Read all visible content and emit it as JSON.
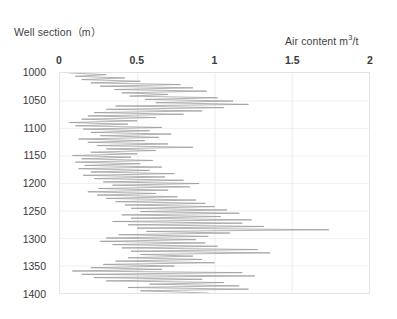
{
  "labels": {
    "y_axis_title": "Well section（m）",
    "x_axis_title_text": "Air content m",
    "x_axis_title_sup": "3",
    "x_axis_title_tail": "/t",
    "x_axis_title_full": "Air content m3/t"
  },
  "colors": {
    "series_line": "#9a9a9a",
    "plot_border": "#e3e3e5",
    "gridline_vertical": "#ececed",
    "gridline_horizontal": "#f1f1f2",
    "text": "#3a3a3a",
    "background": "#ffffff"
  },
  "chart_data": {
    "type": "line",
    "title": "",
    "subtitle": "",
    "orientation": "vertical-depth-log",
    "xlabel": "Air content m3/t",
    "ylabel": "Well section（m）",
    "xlim": [
      0,
      2
    ],
    "ylim": [
      1400,
      1000
    ],
    "y_inverted": true,
    "grid": true,
    "grid_axis": "both",
    "legend": false,
    "legend_position": "none",
    "xticks": [
      0,
      0.5,
      1,
      1.5,
      2
    ],
    "xtick_labels": [
      "0",
      "0.5",
      "1",
      "1.5",
      "2"
    ],
    "yticks": [
      1000,
      1050,
      1100,
      1150,
      1200,
      1250,
      1300,
      1350,
      1400
    ],
    "ytick_labels": [
      "1000",
      "1050",
      "1100",
      "1150",
      "1200",
      "1250",
      "1300",
      "1350",
      "1400"
    ],
    "annotations": [],
    "series": [
      {
        "name": "Air content",
        "x_key": "air_content",
        "y_key": "depth",
        "depth": [
          1000,
          1003,
          1006,
          1009,
          1012,
          1015,
          1018,
          1021,
          1024,
          1027,
          1030,
          1033,
          1036,
          1039,
          1042,
          1045,
          1048,
          1051,
          1054,
          1057,
          1060,
          1063,
          1066,
          1069,
          1072,
          1075,
          1078,
          1081,
          1084,
          1087,
          1090,
          1093,
          1096,
          1099,
          1102,
          1105,
          1108,
          1111,
          1114,
          1117,
          1120,
          1123,
          1126,
          1129,
          1132,
          1135,
          1138,
          1141,
          1144,
          1147,
          1150,
          1153,
          1156,
          1159,
          1162,
          1165,
          1168,
          1171,
          1174,
          1177,
          1180,
          1183,
          1186,
          1189,
          1192,
          1195,
          1198,
          1201,
          1204,
          1207,
          1210,
          1213,
          1216,
          1219,
          1222,
          1225,
          1228,
          1231,
          1234,
          1237,
          1240,
          1243,
          1246,
          1249,
          1252,
          1255,
          1258,
          1261,
          1264,
          1267,
          1270,
          1273,
          1276,
          1279,
          1282,
          1285,
          1288,
          1291,
          1294,
          1297,
          1300,
          1303,
          1306,
          1309,
          1312,
          1315,
          1318,
          1321,
          1324,
          1327,
          1330,
          1333,
          1336,
          1339,
          1342,
          1345,
          1348,
          1351,
          1354,
          1357,
          1360,
          1363,
          1366,
          1369,
          1372,
          1375,
          1378,
          1381,
          1384,
          1387,
          1390,
          1393,
          1396,
          1400
        ],
        "air_content": [
          0.06,
          0.3,
          0.1,
          0.42,
          0.14,
          0.52,
          0.2,
          0.78,
          0.26,
          0.86,
          0.35,
          0.95,
          0.4,
          0.7,
          0.45,
          1.02,
          0.55,
          1.12,
          0.62,
          1.22,
          0.36,
          1.06,
          0.3,
          0.92,
          0.22,
          0.8,
          0.18,
          0.62,
          0.14,
          0.5,
          0.06,
          0.44,
          0.1,
          0.66,
          0.15,
          0.58,
          0.2,
          0.72,
          0.26,
          0.64,
          0.12,
          0.55,
          0.18,
          0.7,
          0.24,
          0.86,
          0.3,
          0.62,
          0.2,
          0.5,
          0.08,
          0.46,
          0.14,
          0.6,
          0.1,
          0.52,
          0.16,
          0.66,
          0.12,
          0.58,
          0.2,
          0.74,
          0.15,
          0.68,
          0.22,
          0.8,
          0.28,
          0.9,
          0.34,
          0.84,
          0.25,
          0.7,
          0.18,
          0.62,
          0.24,
          0.76,
          0.3,
          0.88,
          0.36,
          0.94,
          0.42,
          1.0,
          0.46,
          1.08,
          0.52,
          1.16,
          0.4,
          1.04,
          0.46,
          1.24,
          0.34,
          1.18,
          0.44,
          1.32,
          0.5,
          1.74,
          0.56,
          1.1,
          0.38,
          0.96,
          0.3,
          0.88,
          0.26,
          0.94,
          0.34,
          1.02,
          0.4,
          1.28,
          0.46,
          1.36,
          0.52,
          0.86,
          0.44,
          0.92,
          0.36,
          1.0,
          0.28,
          0.74,
          0.2,
          0.66,
          0.08,
          1.18,
          0.14,
          1.26,
          0.22,
          0.92,
          0.3,
          1.06,
          0.58,
          1.16,
          0.44,
          1.22,
          0.52,
          0.96
        ]
      }
    ]
  }
}
